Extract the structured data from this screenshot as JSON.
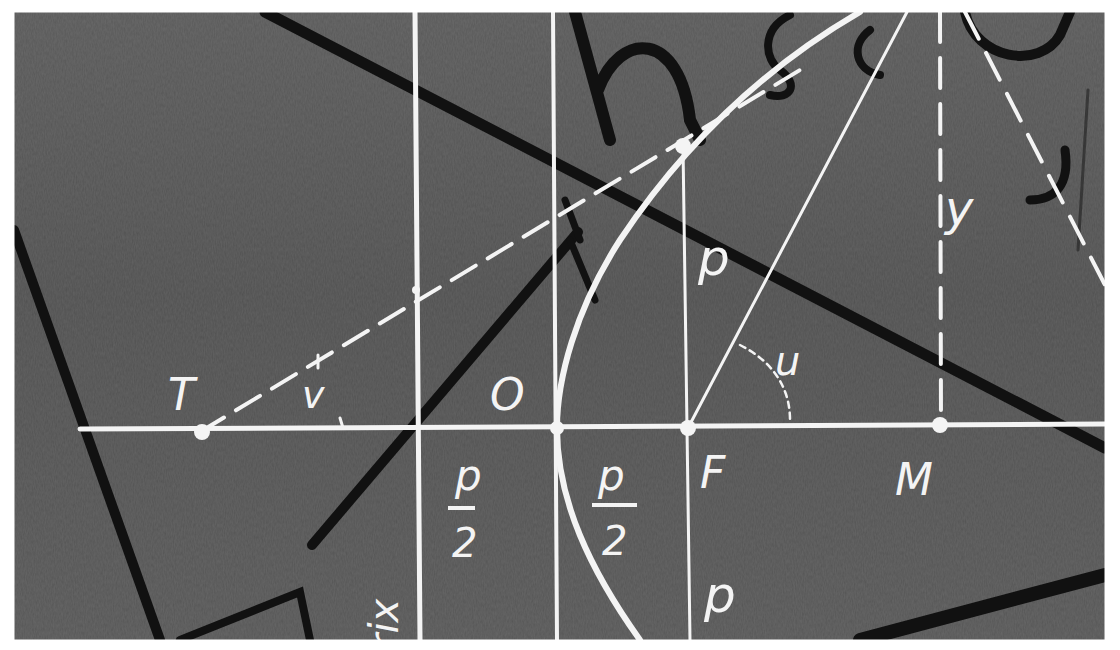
{
  "diagram": {
    "background": {
      "board_color": "#5a5a5a",
      "chalk_color": "#f4f4f4",
      "marker_color": "#111111",
      "frame_color": "#ffffff"
    },
    "labels": {
      "tangent_point": "T",
      "tangent_angle": "v",
      "vertex": "O",
      "half_param_left_num": "p",
      "half_param_left_den": "2",
      "half_param_right_num": "p",
      "half_param_right_den": "2",
      "focus": "F",
      "param_upper": "p",
      "param_lower": "p",
      "angle_at_focus": "u",
      "ordinate": "y",
      "foot_point": "M",
      "directrix_fragment": "rix"
    },
    "elements": [
      {
        "name": "axis",
        "type": "line",
        "style": "solid"
      },
      {
        "name": "directrix",
        "type": "line",
        "style": "solid"
      },
      {
        "name": "vertex-tangent",
        "type": "line",
        "style": "solid"
      },
      {
        "name": "latus-rectum",
        "type": "line",
        "style": "solid"
      },
      {
        "name": "parabola",
        "type": "curve",
        "style": "solid"
      },
      {
        "name": "tangent-line",
        "type": "line",
        "style": "dashed"
      },
      {
        "name": "focal-radius",
        "type": "line",
        "style": "solid"
      },
      {
        "name": "ordinate-line",
        "type": "line",
        "style": "dashed"
      },
      {
        "name": "normal-line",
        "type": "line",
        "style": "dashed"
      }
    ],
    "points": [
      {
        "name": "T",
        "x": 200,
        "y": 432
      },
      {
        "name": "O",
        "x": 557,
        "y": 428
      },
      {
        "name": "F",
        "x": 688,
        "y": 428
      },
      {
        "name": "M",
        "x": 940,
        "y": 425
      },
      {
        "name": "latus-top",
        "x": 683,
        "y": 146
      }
    ]
  }
}
